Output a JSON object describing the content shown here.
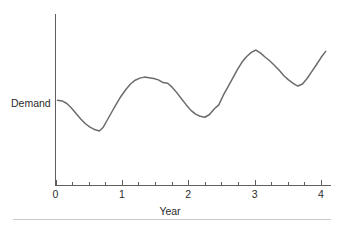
{
  "chart_data": {
    "type": "line",
    "title": "",
    "xlabel": "Year",
    "ylabel": "Demand",
    "xlim": [
      0,
      4.15
    ],
    "ylim": [
      0,
      1
    ],
    "grid": false,
    "legend": null,
    "xticks": [
      0,
      1,
      2,
      3,
      4
    ],
    "xticklabels": [
      "0",
      "1",
      "2",
      "3",
      "4"
    ],
    "xminorticks": [
      0.25,
      0.5,
      0.75,
      1.25,
      1.5,
      1.75,
      2.25,
      2.5,
      2.75,
      3.25,
      3.5,
      3.75
    ],
    "yticks": [],
    "yticklabels": [],
    "series": [
      {
        "name": "Demand",
        "color": "#6b6b6b",
        "x": [
          0.03,
          0.1,
          0.17,
          0.24,
          0.31,
          0.38,
          0.45,
          0.52,
          0.59,
          0.66,
          0.72,
          0.78,
          0.85,
          0.92,
          0.99,
          1.06,
          1.13,
          1.2,
          1.27,
          1.34,
          1.41,
          1.48,
          1.55,
          1.62,
          1.69,
          1.76,
          1.83,
          1.9,
          1.97,
          2.04,
          2.11,
          2.18,
          2.25,
          2.32,
          2.39,
          2.46,
          2.53,
          2.6,
          2.67,
          2.74,
          2.81,
          2.88,
          2.95,
          3.02,
          3.09,
          3.16,
          3.23,
          3.3,
          3.37,
          3.44,
          3.51,
          3.58,
          3.65,
          3.72,
          3.79,
          3.86,
          3.93,
          4.0,
          4.07
        ],
        "y": [
          0.497,
          0.493,
          0.478,
          0.452,
          0.42,
          0.388,
          0.36,
          0.34,
          0.326,
          0.318,
          0.34,
          0.382,
          0.43,
          0.478,
          0.522,
          0.56,
          0.592,
          0.614,
          0.626,
          0.632,
          0.628,
          0.624,
          0.616,
          0.6,
          0.596,
          0.572,
          0.54,
          0.504,
          0.47,
          0.438,
          0.416,
          0.404,
          0.398,
          0.414,
          0.446,
          0.47,
          0.528,
          0.576,
          0.626,
          0.676,
          0.72,
          0.752,
          0.776,
          0.79,
          0.772,
          0.748,
          0.726,
          0.7,
          0.672,
          0.64,
          0.616,
          0.596,
          0.58,
          0.592,
          0.624,
          0.664,
          0.704,
          0.746,
          0.782
        ]
      }
    ],
    "annotations": []
  },
  "axis": {
    "x_title": "Year",
    "y_title": "Demand"
  }
}
